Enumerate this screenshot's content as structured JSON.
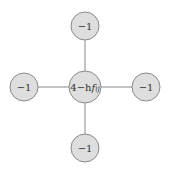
{
  "diagram": {
    "type": "five-point stencil",
    "center": {
      "label_main": "4−h",
      "label_f": "f",
      "label_sub": "ij"
    },
    "neighbors": {
      "top": {
        "label": "−1"
      },
      "left": {
        "label": "−1"
      },
      "right": {
        "label": "−1"
      },
      "bottom": {
        "label": "−1"
      }
    },
    "colors": {
      "node_fill": "#dedede",
      "node_stroke": "#8a8a8a",
      "edge": "#8a8a8a",
      "text": "#333333"
    }
  }
}
